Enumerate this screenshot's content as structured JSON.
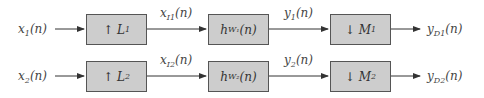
{
  "diagram": {
    "type": "block-diagram",
    "rows": [
      {
        "input": {
          "base": "x",
          "sub": "1",
          "arg": "(n)"
        },
        "blocks": [
          {
            "symbol": "↑",
            "base": "L",
            "sub": "1",
            "arg": ""
          },
          {
            "symbol": "",
            "base": "h",
            "sub": "W₁",
            "arg": "(n)"
          },
          {
            "symbol": "↓",
            "base": "M",
            "sub": "1",
            "arg": ""
          }
        ],
        "edges": [
          {
            "base": "x",
            "sub": "I1",
            "arg": "(n)"
          },
          {
            "base": "y",
            "sub": "1",
            "arg": "(n)"
          }
        ],
        "output": {
          "base": "y",
          "sub": "D1",
          "arg": "(n)"
        }
      },
      {
        "input": {
          "base": "x",
          "sub": "2",
          "arg": "(n)"
        },
        "blocks": [
          {
            "symbol": "↑",
            "base": "L",
            "sub": "2",
            "arg": ""
          },
          {
            "symbol": "",
            "base": "h",
            "sub": "W₂",
            "arg": "(n)"
          },
          {
            "symbol": "↓",
            "base": "M",
            "sub": "2",
            "arg": ""
          }
        ],
        "edges": [
          {
            "base": "x",
            "sub": "I2",
            "arg": "(n)"
          },
          {
            "base": "y",
            "sub": "2",
            "arg": "(n)"
          }
        ],
        "output": {
          "base": "y",
          "sub": "D2",
          "arg": "(n)"
        }
      }
    ],
    "colors": {
      "block_fill": "#cdcdcd",
      "block_border": "#555555",
      "line": "#333333"
    }
  }
}
